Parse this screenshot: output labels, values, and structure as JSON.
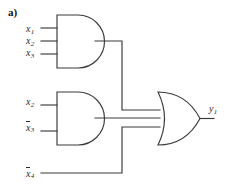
{
  "figure": {
    "panel_label": "a)",
    "type": "logic-circuit-diagram",
    "stroke_color": "#3a3a3a",
    "text_color": "#2b2b2b",
    "background": "#ffffff"
  },
  "signals": {
    "x1": {
      "base": "x",
      "subscript": "1",
      "negated": false
    },
    "x2_top": {
      "base": "x",
      "subscript": "2",
      "negated": false
    },
    "x3_top": {
      "base": "x",
      "subscript": "3",
      "negated": false
    },
    "x2_mid": {
      "base": "x",
      "subscript": "2",
      "negated": false
    },
    "x3_mid_not": {
      "base": "x",
      "subscript": "3",
      "negated": true
    },
    "x4_not": {
      "base": "x",
      "subscript": "4",
      "negated": true
    },
    "y1": {
      "base": "y",
      "subscript": "1",
      "negated": false
    }
  },
  "gates": [
    {
      "id": "and-top",
      "type": "AND",
      "inputs": [
        "x1",
        "x2_top",
        "x3_top"
      ],
      "output": "and-top-out"
    },
    {
      "id": "and-middle",
      "type": "AND",
      "inputs": [
        "x2_mid",
        "x3_mid_not"
      ],
      "output": "and-middle-out"
    },
    {
      "id": "or-output",
      "type": "OR",
      "inputs": [
        "and-top-out",
        "and-middle-out",
        "x4_not"
      ],
      "output": "y1"
    }
  ]
}
